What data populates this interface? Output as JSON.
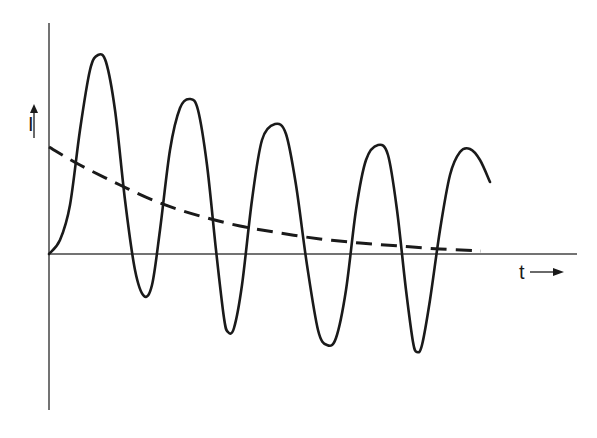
{
  "figure": {
    "background": "#ffffff",
    "ink_color": "#1a1a1a",
    "axis_color": "#444444"
  },
  "axes": {
    "y_label": "I",
    "y_arrow": "up-arrow",
    "x_label": "t",
    "x_arrow": "right-arrow"
  },
  "chart_data": {
    "type": "line",
    "title": "",
    "xlabel": "t",
    "ylabel": "I",
    "grid": false,
    "legend": null,
    "series": [
      {
        "name": "oscillating current",
        "style": "solid",
        "points_px": [
          [
            49,
            254
          ],
          [
            60,
            240
          ],
          [
            70,
            205
          ],
          [
            80,
            130
          ],
          [
            90,
            70
          ],
          [
            98,
            55
          ],
          [
            106,
            62
          ],
          [
            115,
            110
          ],
          [
            125,
            200
          ],
          [
            135,
            270
          ],
          [
            144,
            296
          ],
          [
            152,
            285
          ],
          [
            160,
            230
          ],
          [
            170,
            150
          ],
          [
            180,
            108
          ],
          [
            190,
            99
          ],
          [
            198,
            110
          ],
          [
            207,
            165
          ],
          [
            216,
            250
          ],
          [
            224,
            318
          ],
          [
            228,
            332
          ],
          [
            234,
            328
          ],
          [
            242,
            285
          ],
          [
            252,
            200
          ],
          [
            262,
            140
          ],
          [
            275,
            124
          ],
          [
            286,
            134
          ],
          [
            296,
            185
          ],
          [
            307,
            265
          ],
          [
            318,
            330
          ],
          [
            327,
            345
          ],
          [
            336,
            338
          ],
          [
            346,
            290
          ],
          [
            356,
            210
          ],
          [
            366,
            160
          ],
          [
            378,
            145
          ],
          [
            388,
            155
          ],
          [
            397,
            210
          ],
          [
            406,
            290
          ],
          [
            413,
            342
          ],
          [
            417,
            352
          ],
          [
            422,
            345
          ],
          [
            430,
            300
          ],
          [
            440,
            230
          ],
          [
            450,
            175
          ],
          [
            460,
            152
          ],
          [
            470,
            149
          ],
          [
            480,
            160
          ],
          [
            490,
            182
          ]
        ],
        "peaks_px": [
          [
            98,
            55
          ],
          [
            190,
            99
          ],
          [
            275,
            124
          ],
          [
            378,
            145
          ],
          [
            470,
            149
          ]
        ],
        "troughs_px": [
          [
            144,
            296
          ],
          [
            228,
            332
          ],
          [
            327,
            345
          ],
          [
            417,
            352
          ]
        ]
      },
      {
        "name": "decaying envelope",
        "style": "dashed",
        "points_px": [
          [
            49,
            147
          ],
          [
            80,
            165
          ],
          [
            120,
            185
          ],
          [
            160,
            203
          ],
          [
            200,
            216
          ],
          [
            240,
            226
          ],
          [
            280,
            233
          ],
          [
            320,
            239
          ],
          [
            360,
            243
          ],
          [
            400,
            246
          ],
          [
            440,
            249
          ],
          [
            481,
            251
          ]
        ]
      }
    ],
    "origin_px": [
      49,
      254
    ],
    "y_axis_px": {
      "x": 49,
      "top": 23,
      "bottom": 410
    },
    "x_axis_px": {
      "y": 254,
      "left": 49,
      "right": 577
    }
  }
}
